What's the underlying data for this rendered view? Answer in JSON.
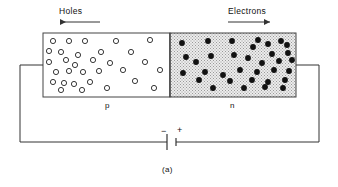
{
  "figure": {
    "caption": "(a)",
    "title_holes": "Holes",
    "title_electrons": "Electrons",
    "region_p_label": "p",
    "region_n_label": "n",
    "battery_minus": "−",
    "battery_plus": "+",
    "colors": {
      "line": "#333333",
      "block_border": "#444444",
      "p_fill": "#ffffff",
      "n_fill": "#e8e8e8",
      "n_stipple": "#9a9a9a",
      "hole_stroke": "#222222",
      "hole_fill": "#ffffff",
      "electron_fill": "#111111",
      "text": "#111111"
    }
  },
  "chart_data": {
    "type": "diagram",
    "block": {
      "x": 43,
      "y": 33,
      "width": 253,
      "height": 64,
      "junction_x": 170
    },
    "arrows": [
      {
        "name": "holes-arrow",
        "label": "Holes",
        "direction": "left",
        "x1": 100,
        "x2": 58,
        "y": 22
      },
      {
        "name": "electrons-arrow",
        "label": "Electrons",
        "direction": "right",
        "x1": 228,
        "x2": 272,
        "y": 22
      }
    ],
    "circuit": {
      "left_wire": [
        [
          43,
          65
        ],
        [
          20,
          65
        ],
        [
          20,
          142
        ]
      ],
      "right_wire": [
        [
          296,
          65
        ],
        [
          319,
          65
        ],
        [
          319,
          142
        ]
      ],
      "bottom_wire_left": [
        [
          20,
          142
        ],
        [
          167,
          142
        ]
      ],
      "bottom_wire_right": [
        [
          176,
          142
        ],
        [
          319,
          142
        ]
      ],
      "battery": {
        "long_plate_x": 167,
        "short_plate_x": 176,
        "long_half_height": 8,
        "short_half_height": 4,
        "y": 142
      }
    },
    "holes": [
      [
        53,
        41
      ],
      [
        69,
        41
      ],
      [
        85,
        41
      ],
      [
        116,
        41
      ],
      [
        150,
        40
      ],
      [
        49,
        51
      ],
      [
        61,
        52
      ],
      [
        78,
        55
      ],
      [
        101,
        52
      ],
      [
        131,
        52
      ],
      [
        49,
        62
      ],
      [
        66,
        60
      ],
      [
        75,
        65
      ],
      [
        93,
        60
      ],
      [
        110,
        63
      ],
      [
        145,
        62
      ],
      [
        56,
        72
      ],
      [
        69,
        71
      ],
      [
        83,
        72
      ],
      [
        99,
        71
      ],
      [
        123,
        70
      ],
      [
        160,
        70
      ],
      [
        53,
        82
      ],
      [
        64,
        83
      ],
      [
        74,
        84
      ],
      [
        90,
        82
      ],
      [
        135,
        81
      ],
      [
        61,
        90
      ],
      [
        82,
        90
      ],
      [
        107,
        88
      ],
      [
        154,
        88
      ]
    ],
    "electrons": [
      [
        182,
        43
      ],
      [
        208,
        41
      ],
      [
        232,
        41
      ],
      [
        258,
        40
      ],
      [
        281,
        41
      ],
      [
        253,
        47
      ],
      [
        268,
        44
      ],
      [
        287,
        45
      ],
      [
        186,
        57
      ],
      [
        211,
        56
      ],
      [
        234,
        55
      ],
      [
        248,
        58
      ],
      [
        272,
        54
      ],
      [
        288,
        53
      ],
      [
        196,
        62
      ],
      [
        262,
        63
      ],
      [
        279,
        61
      ],
      [
        292,
        60
      ],
      [
        183,
        73
      ],
      [
        205,
        72
      ],
      [
        223,
        75
      ],
      [
        240,
        70
      ],
      [
        257,
        72
      ],
      [
        274,
        70
      ],
      [
        289,
        71
      ],
      [
        199,
        80
      ],
      [
        230,
        81
      ],
      [
        252,
        80
      ],
      [
        268,
        82
      ],
      [
        285,
        80
      ],
      [
        213,
        88
      ],
      [
        244,
        88
      ],
      [
        265,
        87
      ],
      [
        283,
        88
      ]
    ]
  }
}
